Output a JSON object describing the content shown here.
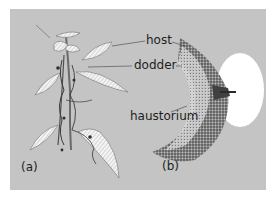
{
  "figure": {
    "labels": {
      "host": "host",
      "dodder": "dodder",
      "haustorium": "haustorium",
      "panel_a": "(a)",
      "panel_b": "(b)"
    },
    "colors": {
      "background": "#c4c4c4",
      "label_text": "#1e1e1e",
      "leaf_fill": "#f4f4f4",
      "tissue_dark": "#505050",
      "oval_fill": "#ffffff"
    }
  }
}
